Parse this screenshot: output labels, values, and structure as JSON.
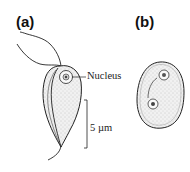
{
  "figure": {
    "panels": [
      {
        "id": "a",
        "label": "(a)",
        "subject": "trophozoite",
        "annotations": {
          "nucleus_label": "Nucleus",
          "scale_bar_label": "5 µm"
        }
      },
      {
        "id": "b",
        "label": "(b)",
        "subject": "cyst"
      }
    ],
    "colors": {
      "outline": "#222222",
      "cytoplasm_fill": "#e9e9e9",
      "background": "#ffffff"
    }
  }
}
